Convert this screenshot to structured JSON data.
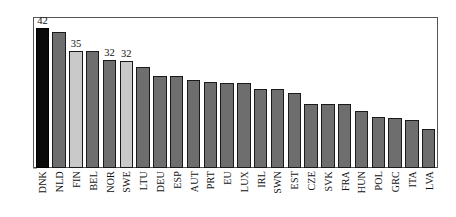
{
  "chart_data": {
    "type": "bar",
    "title": "",
    "xlabel": "",
    "ylabel": "",
    "ylim": [
      0,
      45
    ],
    "yticks": [
      0,
      5,
      10,
      15,
      20,
      25,
      30,
      35,
      40,
      45
    ],
    "grid": false,
    "legend": "none",
    "categories": [
      "DNK",
      "NLD",
      "FIN",
      "BEL",
      "NOR",
      "SWE",
      "LTU",
      "DEU",
      "ESP",
      "AUT",
      "PRT",
      "EU",
      "LUX",
      "IRL",
      "SWN",
      "EST",
      "CZE",
      "SVK",
      "FRA",
      "HUN",
      "POL",
      "GRC",
      "ITA",
      "LVA"
    ],
    "values": [
      42,
      40.7,
      35.2,
      35.1,
      32.4,
      32.2,
      30.3,
      27.6,
      27.5,
      26.3,
      25.7,
      25.4,
      25.4,
      23.6,
      23.6,
      22.6,
      19.3,
      19.2,
      19.1,
      17.1,
      15.2,
      15.1,
      14.3,
      11.6
    ],
    "data_labels": [
      {
        "category": "DNK",
        "text": "42"
      },
      {
        "category": "FIN",
        "text": "35"
      },
      {
        "category": "NOR",
        "text": "32"
      },
      {
        "category": "SWE",
        "text": "32"
      }
    ],
    "bar_styles": [
      {
        "category": "DNK",
        "style": "dark",
        "color": "#0a0a0a"
      },
      {
        "category": "FIN",
        "style": "light",
        "color": "#c9c9c9"
      },
      {
        "category": "SWE",
        "style": "light",
        "color": "#c9c9c9"
      }
    ],
    "default_bar_color": "#6e6e6e",
    "bar_border_color": "#1a1a1a",
    "axis_color": "#555555"
  }
}
